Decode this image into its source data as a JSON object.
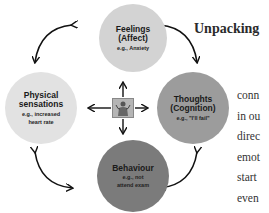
{
  "heading": "Unpacking",
  "nodes": {
    "feelings": {
      "title_line1": "Feelings",
      "title_line2": "(Affect)",
      "example": "e.g., Anxiety",
      "color": "#d3d3d3"
    },
    "physical": {
      "title_line1": "Physical",
      "title_line2": "sensations",
      "example_line1": "e.g., increased",
      "example_line2": "heart rate",
      "color": "#e2e2e2"
    },
    "thoughts": {
      "title_line1": "Thoughts",
      "title_line2": "(Cognition)",
      "example": "e.g., \"I'll fail\"",
      "color": "#9c9c9c"
    },
    "behaviour": {
      "title_line1": "Behaviour",
      "example_line1": "e.g., not",
      "example_line2": "attend exam",
      "color": "#7b7b7b"
    }
  },
  "center_icon": "person-body-icon",
  "paragraph_lines": [
    "conn",
    "in ou",
    "direc",
    "emot",
    "start",
    "even"
  ]
}
